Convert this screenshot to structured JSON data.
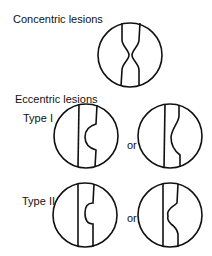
{
  "diagram": {
    "sections": [
      {
        "title": "Concentric lesions",
        "figures": [
          {
            "id": "concentric",
            "description": "Symmetric narrowing of vessel lumen from both walls"
          }
        ]
      },
      {
        "title": "Eccentric lesions",
        "types": [
          {
            "label": "Type I",
            "connector": "or",
            "figures": [
              {
                "id": "type1-a",
                "description": "Smooth concave bulge of one wall"
              },
              {
                "id": "type1-b",
                "description": "Smooth S-shaped bulge of one wall"
              }
            ]
          },
          {
            "label": "Type II",
            "connector": "or",
            "figures": [
              {
                "id": "type2-a",
                "description": "Narrow-necked overhanging bulge of one wall"
              },
              {
                "id": "type2-b",
                "description": "Irregular scalloped bulge of one wall"
              }
            ]
          }
        ]
      }
    ],
    "colors": {
      "line": "#111111",
      "background": "#ffffff"
    }
  }
}
